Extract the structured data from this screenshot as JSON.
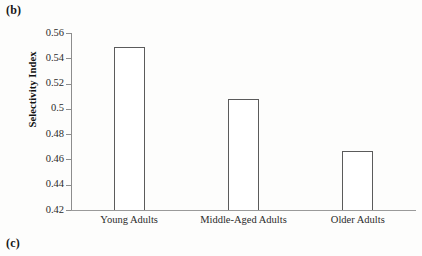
{
  "figure": {
    "panel_label": "(b)",
    "next_panel_label": "(c)"
  },
  "chart_data": {
    "type": "bar",
    "title": "",
    "xlabel": "",
    "ylabel": "Selectivity Index",
    "categories": [
      "Young Adults",
      "Middle-Aged Adults",
      "Older Adults"
    ],
    "values": [
      0.549,
      0.508,
      0.467
    ],
    "ylim": [
      0.42,
      0.56
    ],
    "ytick_labels": [
      "0.56",
      "0.54",
      "0.52",
      "0.5",
      "0.48",
      "0.46",
      "0.44",
      "0.42"
    ],
    "ytick_values": [
      0.56,
      0.54,
      0.52,
      0.5,
      0.48,
      0.46,
      0.44,
      0.42
    ],
    "grid": false,
    "legend": null,
    "bar_fill_color": "#ffffff",
    "bar_edge_color": "#5b5b5b",
    "axis_color": "#8d8d8d"
  }
}
